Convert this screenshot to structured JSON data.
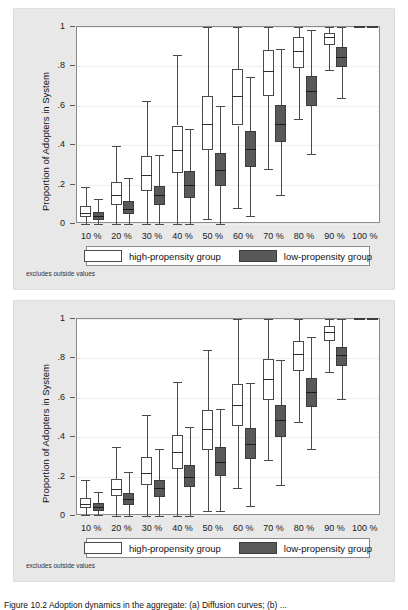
{
  "figure": {
    "caption": "Figure 10.2  Adoption dynamics in the aggregate: (a) Diffusion curves; (b) ...",
    "note": "excludes outside values"
  },
  "legend": {
    "high_label": "high-propensity group",
    "low_label": "low-propensity group",
    "high_color": "#ffffff",
    "low_color": "#595959",
    "border_color": "#4a4a4a"
  },
  "axis": {
    "ylabel": "Proportion of Adopters in System",
    "yticks": [
      "0",
      ".2",
      ".4",
      ".6",
      ".8",
      "1"
    ],
    "ytick_values": [
      0,
      0.2,
      0.4,
      0.6,
      0.8,
      1
    ],
    "ylim": [
      0,
      1
    ],
    "xticks": [
      "10 %",
      "20 %",
      "30 %",
      "40 %",
      "50 %",
      "60 %",
      "70 %",
      "80 %",
      "90 %",
      "100 %"
    ]
  },
  "chart_data": [
    {
      "type": "box",
      "panel": "top",
      "title": "",
      "xlabel": "",
      "ylabel": "Proportion of Adopters in System",
      "ylim": [
        0,
        1
      ],
      "grid": true,
      "legend_position": "below-axis",
      "categories": [
        "10 %",
        "20 %",
        "30 %",
        "40 %",
        "50 %",
        "60 %",
        "70 %",
        "80 %",
        "90 %",
        "100 %"
      ],
      "series": [
        {
          "name": "high-propensity group",
          "color": "#ffffff",
          "boxes": [
            {
              "whisker_low": 0.0,
              "q1": 0.035,
              "median": 0.055,
              "q3": 0.09,
              "whisker_high": 0.19
            },
            {
              "whisker_low": 0.0,
              "q1": 0.095,
              "median": 0.145,
              "q3": 0.215,
              "whisker_high": 0.395
            },
            {
              "whisker_low": 0.0,
              "q1": 0.165,
              "median": 0.25,
              "q3": 0.345,
              "whisker_high": 0.625
            },
            {
              "whisker_low": 0.0,
              "q1": 0.26,
              "median": 0.375,
              "q3": 0.5,
              "whisker_high": 0.86
            },
            {
              "whisker_low": 0.025,
              "q1": 0.375,
              "median": 0.51,
              "q3": 0.65,
              "whisker_high": 1.0
            },
            {
              "whisker_low": 0.08,
              "q1": 0.5,
              "median": 0.65,
              "q3": 0.785,
              "whisker_high": 1.0
            },
            {
              "whisker_low": 0.28,
              "q1": 0.65,
              "median": 0.775,
              "q3": 0.885,
              "whisker_high": 1.0
            },
            {
              "whisker_low": 0.535,
              "q1": 0.79,
              "median": 0.88,
              "q3": 0.95,
              "whisker_high": 1.0
            },
            {
              "whisker_low": 0.78,
              "q1": 0.91,
              "median": 0.95,
              "q3": 0.97,
              "whisker_high": 1.0
            },
            {
              "whisker_low": 1.0,
              "q1": 1.0,
              "median": 1.0,
              "q3": 1.0,
              "whisker_high": 1.0
            }
          ]
        },
        {
          "name": "low-propensity group",
          "color": "#595959",
          "boxes": [
            {
              "whisker_low": 0.0,
              "q1": 0.02,
              "median": 0.04,
              "q3": 0.06,
              "whisker_high": 0.125
            },
            {
              "whisker_low": 0.0,
              "q1": 0.05,
              "median": 0.075,
              "q3": 0.115,
              "whisker_high": 0.235
            },
            {
              "whisker_low": 0.0,
              "q1": 0.095,
              "median": 0.145,
              "q3": 0.195,
              "whisker_high": 0.35
            },
            {
              "whisker_low": 0.0,
              "q1": 0.13,
              "median": 0.2,
              "q3": 0.27,
              "whisker_high": 0.48
            },
            {
              "whisker_low": 0.0,
              "q1": 0.195,
              "median": 0.275,
              "q3": 0.36,
              "whisker_high": 0.6
            },
            {
              "whisker_low": 0.04,
              "q1": 0.29,
              "median": 0.38,
              "q3": 0.47,
              "whisker_high": 0.745
            },
            {
              "whisker_low": 0.145,
              "q1": 0.415,
              "median": 0.51,
              "q3": 0.605,
              "whisker_high": 0.89
            },
            {
              "whisker_low": 0.355,
              "q1": 0.6,
              "median": 0.675,
              "q3": 0.75,
              "whisker_high": 0.985
            },
            {
              "whisker_low": 0.64,
              "q1": 0.795,
              "median": 0.85,
              "q3": 0.9,
              "whisker_high": 1.0
            },
            {
              "whisker_low": 1.0,
              "q1": 1.0,
              "median": 1.0,
              "q3": 1.0,
              "whisker_high": 1.0
            }
          ]
        }
      ]
    },
    {
      "type": "box",
      "panel": "bottom",
      "title": "",
      "xlabel": "",
      "ylabel": "Proportion of Adopters in System",
      "ylim": [
        0,
        1
      ],
      "grid": true,
      "legend_position": "below-axis",
      "categories": [
        "10 %",
        "20 %",
        "30 %",
        "40 %",
        "50 %",
        "60 %",
        "70 %",
        "80 %",
        "90 %",
        "100 %"
      ],
      "series": [
        {
          "name": "high-propensity group",
          "color": "#ffffff",
          "boxes": [
            {
              "whisker_low": 0.005,
              "q1": 0.04,
              "median": 0.06,
              "q3": 0.09,
              "whisker_high": 0.185
            },
            {
              "whisker_low": 0.0,
              "q1": 0.1,
              "median": 0.135,
              "q3": 0.19,
              "whisker_high": 0.35
            },
            {
              "whisker_low": 0.0,
              "q1": 0.155,
              "median": 0.22,
              "q3": 0.3,
              "whisker_high": 0.515
            },
            {
              "whisker_low": 0.0,
              "q1": 0.24,
              "median": 0.325,
              "q3": 0.41,
              "whisker_high": 0.68
            },
            {
              "whisker_low": 0.025,
              "q1": 0.335,
              "median": 0.44,
              "q3": 0.54,
              "whisker_high": 0.845
            },
            {
              "whisker_low": 0.14,
              "q1": 0.455,
              "median": 0.565,
              "q3": 0.67,
              "whisker_high": 1.0
            },
            {
              "whisker_low": 0.285,
              "q1": 0.59,
              "median": 0.695,
              "q3": 0.795,
              "whisker_high": 1.0
            },
            {
              "whisker_low": 0.475,
              "q1": 0.735,
              "median": 0.82,
              "q3": 0.89,
              "whisker_high": 1.0
            },
            {
              "whisker_low": 0.73,
              "q1": 0.89,
              "median": 0.935,
              "q3": 0.965,
              "whisker_high": 1.0
            },
            {
              "whisker_low": 1.0,
              "q1": 1.0,
              "median": 1.0,
              "q3": 1.0,
              "whisker_high": 1.0
            }
          ]
        },
        {
          "name": "low-propensity group",
          "color": "#595959",
          "boxes": [
            {
              "whisker_low": 0.005,
              "q1": 0.025,
              "median": 0.045,
              "q3": 0.065,
              "whisker_high": 0.12
            },
            {
              "whisker_low": 0.0,
              "q1": 0.055,
              "median": 0.085,
              "q3": 0.115,
              "whisker_high": 0.225
            },
            {
              "whisker_low": 0.0,
              "q1": 0.095,
              "median": 0.14,
              "q3": 0.185,
              "whisker_high": 0.34
            },
            {
              "whisker_low": 0.0,
              "q1": 0.145,
              "median": 0.2,
              "q3": 0.26,
              "whisker_high": 0.45
            },
            {
              "whisker_low": 0.025,
              "q1": 0.205,
              "median": 0.275,
              "q3": 0.35,
              "whisker_high": 0.545
            },
            {
              "whisker_low": 0.05,
              "q1": 0.29,
              "median": 0.365,
              "q3": 0.445,
              "whisker_high": 0.675
            },
            {
              "whisker_low": 0.155,
              "q1": 0.4,
              "median": 0.485,
              "q3": 0.565,
              "whisker_high": 0.79
            },
            {
              "whisker_low": 0.34,
              "q1": 0.555,
              "median": 0.63,
              "q3": 0.7,
              "whisker_high": 0.91
            },
            {
              "whisker_low": 0.595,
              "q1": 0.76,
              "median": 0.815,
              "q3": 0.86,
              "whisker_high": 1.0
            },
            {
              "whisker_low": 1.0,
              "q1": 1.0,
              "median": 1.0,
              "q3": 1.0,
              "whisker_high": 1.0
            }
          ]
        }
      ]
    }
  ]
}
